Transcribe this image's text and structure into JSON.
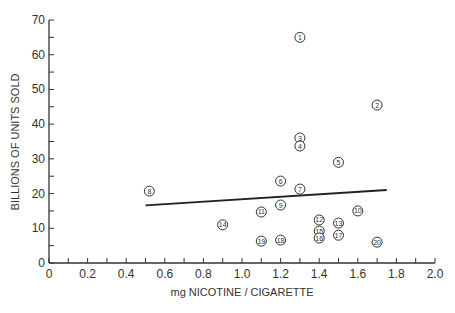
{
  "chart_data": {
    "type": "scatter",
    "title": "",
    "xlabel": "mg NICOTINE / CIGARETTE",
    "ylabel": "BILLIONS OF UNITS SOLD",
    "xlim": [
      0,
      2.0
    ],
    "ylim": [
      0,
      70
    ],
    "grid": false,
    "legend": null,
    "x_ticks": [
      "0",
      "0.2",
      "0.4",
      "0.6",
      "0.8",
      "1.0",
      "1.2",
      "1.4",
      "1.6",
      "1.8",
      "2.0"
    ],
    "y_ticks": [
      "0",
      "10",
      "20",
      "30",
      "40",
      "50",
      "60",
      "70"
    ],
    "points": [
      {
        "label": "1",
        "x": 1.3,
        "y": 65
      },
      {
        "label": "2",
        "x": 1.7,
        "y": 45.5
      },
      {
        "label": "3",
        "x": 1.3,
        "y": 36
      },
      {
        "label": "4",
        "x": 1.3,
        "y": 33.7
      },
      {
        "label": "5",
        "x": 1.5,
        "y": 29
      },
      {
        "label": "6",
        "x": 1.2,
        "y": 23.6
      },
      {
        "label": "7",
        "x": 1.3,
        "y": 21.3
      },
      {
        "label": "8",
        "x": 0.52,
        "y": 20.7
      },
      {
        "label": "9",
        "x": 1.2,
        "y": 16.7
      },
      {
        "label": "10",
        "x": 1.6,
        "y": 15
      },
      {
        "label": "11",
        "x": 1.1,
        "y": 14.7
      },
      {
        "label": "12",
        "x": 1.4,
        "y": 12.4
      },
      {
        "label": "13",
        "x": 1.5,
        "y": 11.5
      },
      {
        "label": "14",
        "x": 0.9,
        "y": 11
      },
      {
        "label": "15",
        "x": 1.4,
        "y": 9.2
      },
      {
        "label": "16",
        "x": 1.4,
        "y": 7.2
      },
      {
        "label": "17",
        "x": 1.5,
        "y": 8
      },
      {
        "label": "18",
        "x": 1.2,
        "y": 6.6
      },
      {
        "label": "19",
        "x": 1.1,
        "y": 6.3
      },
      {
        "label": "20",
        "x": 1.7,
        "y": 6
      }
    ],
    "regression_line": {
      "x": [
        0.5,
        1.75
      ],
      "y": [
        16.6,
        21.0
      ]
    }
  }
}
